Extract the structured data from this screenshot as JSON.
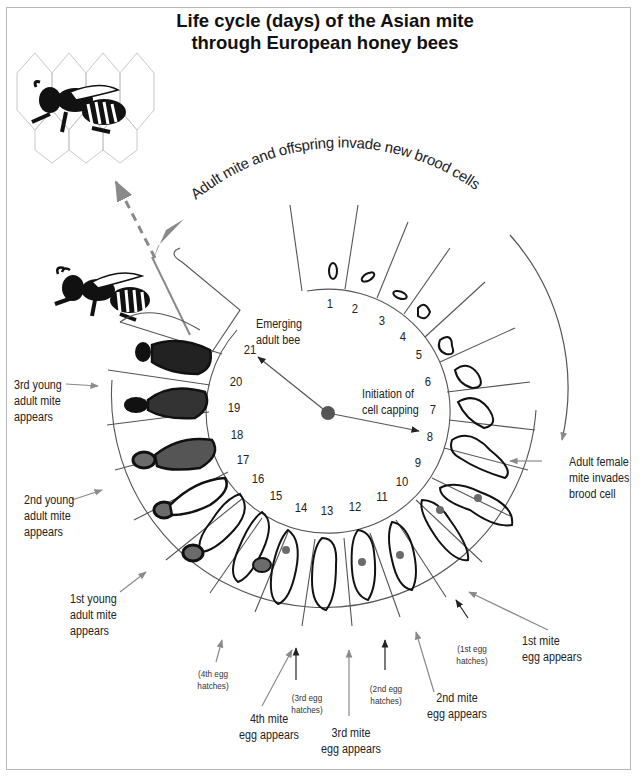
{
  "title": {
    "line1": "Life cycle (days) of the Asian mite",
    "line2": "through European honey bees"
  },
  "arc_caption": "Adult mite and offspring invade  new brood cells",
  "center_labels": {
    "emerging": {
      "line1": "Emerging",
      "line2": "adult bee"
    },
    "capping": {
      "line1": "Initiation of",
      "line2": "cell capping"
    }
  },
  "days": [
    "1",
    "2",
    "3",
    "4",
    "5",
    "6",
    "7",
    "8",
    "9",
    "10",
    "11",
    "12",
    "13",
    "14",
    "15",
    "16",
    "17",
    "18",
    "19",
    "20",
    "21"
  ],
  "annotations": {
    "adult_female": {
      "line1": "Adult female",
      "line2": "mite invades",
      "line3": "brood cell"
    },
    "first_mite_egg": {
      "line1": "1st mite",
      "line2": "egg appears"
    },
    "first_egg_hatches": {
      "line1": "(1st egg",
      "line2": "hatches)"
    },
    "second_mite_egg": {
      "line1": "2nd mite",
      "line2": "egg appears"
    },
    "second_egg_hatches": {
      "line1": "(2nd egg",
      "line2": "hatches)"
    },
    "third_mite_egg": {
      "line1": "3rd mite",
      "line2": "egg appears"
    },
    "third_egg_hatches": {
      "line1": "(3rd egg",
      "line2": "hatches)"
    },
    "fourth_mite_egg": {
      "line1": "4th mite",
      "line2": "egg appears"
    },
    "fourth_egg_hatches": {
      "line1": "(4th egg",
      "line2": "hatches)"
    },
    "first_young_adult": {
      "line1": "1st young",
      "line2": "adult mite",
      "line3": "appears"
    },
    "second_young_adult": {
      "line1": "2nd young",
      "line2": "adult mite",
      "line3": "appears"
    },
    "third_young_adult": {
      "line1": "3rd young",
      "line2": "adult mite",
      "line3": "appears"
    }
  },
  "colors": {
    "line": "#555555",
    "arrow": "#8a8a8a",
    "ink": "#111111",
    "mite": "#6b6b6b",
    "frame": "#b9b9b9"
  }
}
